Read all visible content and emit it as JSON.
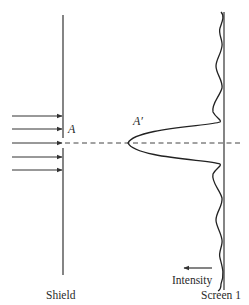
{
  "diagram": {
    "type": "single-slit diffraction schematic",
    "labels": {
      "slit_point": "A",
      "image_point": "A′",
      "shield": "Shield",
      "screen": "Screen 1",
      "intensity": "Intensity"
    },
    "incident_rays": 5,
    "colors": {
      "ink": "#333333",
      "background": "#ffffff"
    }
  }
}
